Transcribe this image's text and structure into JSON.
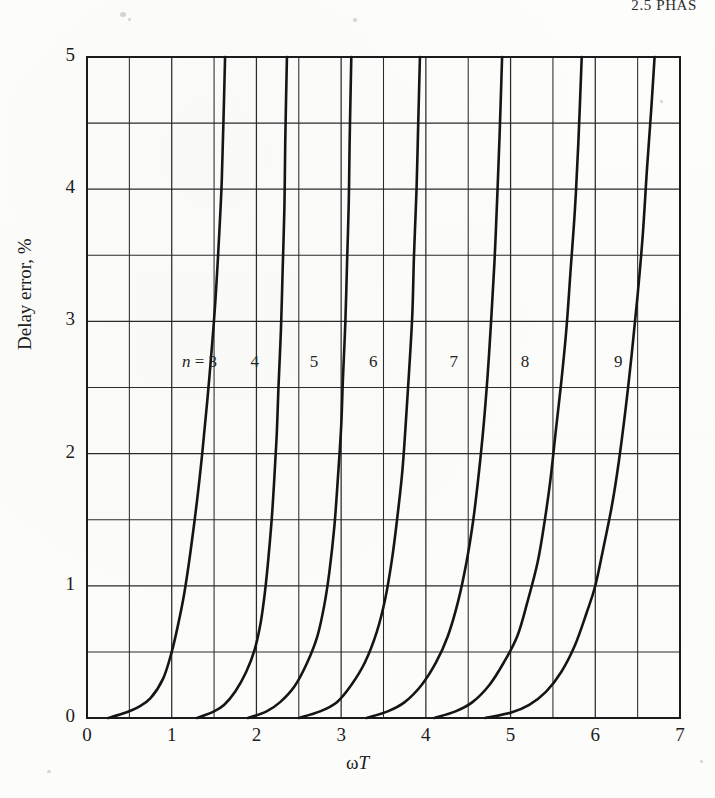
{
  "running_head": "2.5  PHAS",
  "figure": {
    "axes": {
      "x_label_omega": "ω",
      "x_label_var": "T",
      "y_label": "Delay error, %",
      "x_ticks": [
        "0",
        "1",
        "2",
        "3",
        "4",
        "5",
        "6",
        "7"
      ],
      "y_ticks": [
        "0",
        "1",
        "2",
        "3",
        "4",
        "5"
      ]
    },
    "curve_labels": [
      {
        "prefix": "n",
        "eq": " = ",
        "value": "3"
      },
      {
        "value": "4"
      },
      {
        "value": "5"
      },
      {
        "value": "6"
      },
      {
        "value": "7"
      },
      {
        "value": "8"
      },
      {
        "value": "9"
      }
    ],
    "colors": {
      "ink": "#151515",
      "grid": "#3a3a3a",
      "paper": "#fdfdfc"
    }
  },
  "chart_data": {
    "type": "line",
    "title": "",
    "xlabel": "ωT",
    "ylabel": "Delay error, %",
    "xlim": [
      0,
      7
    ],
    "ylim": [
      0,
      5
    ],
    "x_ticks": [
      0,
      1,
      2,
      3,
      4,
      5,
      6,
      7
    ],
    "y_ticks": [
      0,
      1,
      2,
      3,
      4,
      5
    ],
    "x_minor_step": 0.5,
    "y_minor_step": 0.5,
    "grid": true,
    "legend": "inline-curve-labels",
    "series": [
      {
        "name": "n = 3",
        "label": "n = 3",
        "points": [
          [
            0.25,
            0.0
          ],
          [
            0.45,
            0.04
          ],
          [
            0.6,
            0.08
          ],
          [
            0.75,
            0.15
          ],
          [
            0.9,
            0.3
          ],
          [
            1.0,
            0.5
          ],
          [
            1.08,
            0.72
          ],
          [
            1.15,
            0.95
          ],
          [
            1.22,
            1.25
          ],
          [
            1.3,
            1.65
          ],
          [
            1.36,
            2.0
          ],
          [
            1.42,
            2.4
          ],
          [
            1.48,
            2.85
          ],
          [
            1.52,
            3.2
          ],
          [
            1.56,
            3.65
          ],
          [
            1.59,
            4.05
          ],
          [
            1.61,
            4.5
          ],
          [
            1.63,
            5.0
          ]
        ]
      },
      {
        "name": "n = 4",
        "label": "4",
        "points": [
          [
            1.3,
            0.0
          ],
          [
            1.5,
            0.05
          ],
          [
            1.62,
            0.1
          ],
          [
            1.75,
            0.2
          ],
          [
            1.88,
            0.35
          ],
          [
            1.98,
            0.52
          ],
          [
            2.05,
            0.72
          ],
          [
            2.1,
            0.95
          ],
          [
            2.14,
            1.2
          ],
          [
            2.18,
            1.5
          ],
          [
            2.21,
            1.8
          ],
          [
            2.24,
            2.15
          ],
          [
            2.26,
            2.5
          ],
          [
            2.29,
            2.95
          ],
          [
            2.31,
            3.4
          ],
          [
            2.33,
            3.85
          ],
          [
            2.34,
            4.35
          ],
          [
            2.36,
            5.0
          ]
        ]
      },
      {
        "name": "n = 5",
        "label": "5",
        "points": [
          [
            1.9,
            0.0
          ],
          [
            2.12,
            0.05
          ],
          [
            2.28,
            0.12
          ],
          [
            2.45,
            0.24
          ],
          [
            2.6,
            0.42
          ],
          [
            2.72,
            0.62
          ],
          [
            2.8,
            0.85
          ],
          [
            2.86,
            1.1
          ],
          [
            2.92,
            1.45
          ],
          [
            2.96,
            1.8
          ],
          [
            3.0,
            2.2
          ],
          [
            3.02,
            2.55
          ],
          [
            3.05,
            3.0
          ],
          [
            3.07,
            3.45
          ],
          [
            3.09,
            3.9
          ],
          [
            3.1,
            4.35
          ],
          [
            3.12,
            5.0
          ]
        ]
      },
      {
        "name": "n = 6",
        "label": "6",
        "points": [
          [
            2.5,
            0.0
          ],
          [
            2.75,
            0.05
          ],
          [
            2.95,
            0.12
          ],
          [
            3.12,
            0.25
          ],
          [
            3.28,
            0.42
          ],
          [
            3.42,
            0.65
          ],
          [
            3.52,
            0.9
          ],
          [
            3.6,
            1.2
          ],
          [
            3.66,
            1.5
          ],
          [
            3.72,
            1.85
          ],
          [
            3.76,
            2.2
          ],
          [
            3.8,
            2.6
          ],
          [
            3.84,
            3.05
          ],
          [
            3.86,
            3.5
          ],
          [
            3.89,
            4.0
          ],
          [
            3.91,
            4.5
          ],
          [
            3.93,
            5.0
          ]
        ]
      },
      {
        "name": "n = 7",
        "label": "7",
        "points": [
          [
            3.3,
            0.0
          ],
          [
            3.55,
            0.05
          ],
          [
            3.75,
            0.12
          ],
          [
            3.95,
            0.25
          ],
          [
            4.12,
            0.42
          ],
          [
            4.26,
            0.62
          ],
          [
            4.38,
            0.88
          ],
          [
            4.48,
            1.18
          ],
          [
            4.56,
            1.5
          ],
          [
            4.62,
            1.82
          ],
          [
            4.68,
            2.2
          ],
          [
            4.73,
            2.6
          ],
          [
            4.77,
            3.0
          ],
          [
            4.81,
            3.45
          ],
          [
            4.84,
            3.9
          ],
          [
            4.87,
            4.4
          ],
          [
            4.9,
            5.0
          ]
        ]
      },
      {
        "name": "n = 8",
        "label": "8",
        "points": [
          [
            4.1,
            0.0
          ],
          [
            4.35,
            0.05
          ],
          [
            4.55,
            0.12
          ],
          [
            4.75,
            0.25
          ],
          [
            4.92,
            0.42
          ],
          [
            5.08,
            0.62
          ],
          [
            5.2,
            0.88
          ],
          [
            5.32,
            1.18
          ],
          [
            5.4,
            1.48
          ],
          [
            5.47,
            1.8
          ],
          [
            5.53,
            2.15
          ],
          [
            5.6,
            2.55
          ],
          [
            5.66,
            2.95
          ],
          [
            5.71,
            3.4
          ],
          [
            5.76,
            3.85
          ],
          [
            5.8,
            4.35
          ],
          [
            5.84,
            5.0
          ]
        ]
      },
      {
        "name": "n = 9",
        "label": "9",
        "points": [
          [
            4.7,
            0.0
          ],
          [
            5.0,
            0.04
          ],
          [
            5.22,
            0.1
          ],
          [
            5.42,
            0.2
          ],
          [
            5.6,
            0.35
          ],
          [
            5.76,
            0.55
          ],
          [
            5.9,
            0.8
          ],
          [
            6.0,
            1.0
          ],
          [
            6.1,
            1.3
          ],
          [
            6.2,
            1.62
          ],
          [
            6.28,
            1.95
          ],
          [
            6.36,
            2.35
          ],
          [
            6.43,
            2.75
          ],
          [
            6.5,
            3.2
          ],
          [
            6.56,
            3.65
          ],
          [
            6.61,
            4.15
          ],
          [
            6.66,
            4.6
          ],
          [
            6.7,
            5.0
          ]
        ]
      }
    ],
    "curve_label_positions": [
      {
        "name": "n = 3",
        "x": 1.12,
        "y": 2.68
      },
      {
        "name": "n = 4",
        "x": 1.93,
        "y": 2.68
      },
      {
        "name": "n = 5",
        "x": 2.63,
        "y": 2.68
      },
      {
        "name": "n = 6",
        "x": 3.33,
        "y": 2.68
      },
      {
        "name": "n = 7",
        "x": 4.28,
        "y": 2.68
      },
      {
        "name": "n = 8",
        "x": 5.12,
        "y": 2.68
      },
      {
        "name": "n = 9",
        "x": 6.22,
        "y": 2.68
      }
    ]
  }
}
